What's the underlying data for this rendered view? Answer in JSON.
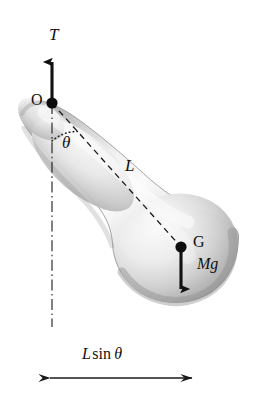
{
  "figure": {
    "kind": "physics-free-body-diagram",
    "background_color": "#ffffff",
    "ink_color": "#111111",
    "body": {
      "name": "pendulum-body",
      "description": "club / bowling-pin shaped rigid body, narrow rounded end at upper left, bulbous end at lower right",
      "fill_light": "#f4f4f4",
      "fill_mid": "#cdcdcd",
      "fill_dark": "#9a9a9a",
      "outline_color": "#8a8a8a"
    },
    "points": [
      {
        "name": "pivot",
        "label": "O",
        "x": 52,
        "y": 103,
        "label_x": 31,
        "label_y": 92
      },
      {
        "name": "center-of-gravity",
        "label": "G",
        "x": 181,
        "y": 247,
        "label_x": 193,
        "label_y": 234
      }
    ],
    "vectors": [
      {
        "name": "tension",
        "label": "T",
        "direction": "up",
        "from_x": 52,
        "from_y": 103,
        "to_x": 52,
        "to_y": 60,
        "label_x": 49,
        "label_y": 26
      },
      {
        "name": "weight",
        "label": "Mg",
        "direction": "down",
        "from_x": 181,
        "from_y": 247,
        "to_x": 181,
        "to_y": 291,
        "label_x": 197,
        "label_y": 256
      }
    ],
    "lines": [
      {
        "name": "pivot-to-cg-line",
        "style": "dashed",
        "label": "L",
        "from_x": 52,
        "from_y": 103,
        "to_x": 181,
        "to_y": 247,
        "label_x": 125,
        "label_y": 157
      },
      {
        "name": "vertical-reference-line",
        "style": "dash-dot",
        "from_x": 52,
        "from_y": 103,
        "to_x": 52,
        "to_y": 327
      }
    ],
    "angle": {
      "name": "theta-angle",
      "label": "θ",
      "style": "dotted-arc",
      "vertex_x": 52,
      "vertex_y": 103,
      "radius": 38,
      "from_deg": 90,
      "to_deg": 48,
      "label_x": 62,
      "label_y": 134
    },
    "dimension": {
      "name": "horizontal-offset-dimension",
      "label_parts": {
        "symbol1": "L",
        "function": "sin",
        "symbol2": "θ"
      },
      "label_text": "L sin θ",
      "arrow_style": "double-headed",
      "from_x": 50,
      "from_y": 378,
      "to_x": 192,
      "to_y": 378,
      "label_x": 82,
      "label_y": 346
    }
  }
}
